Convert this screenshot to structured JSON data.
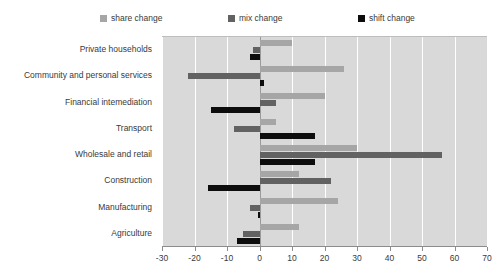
{
  "chart_data": {
    "type": "bar",
    "orientation": "horizontal",
    "title": "",
    "subtitle": "",
    "xlabel": "",
    "ylabel": "",
    "xlim": [
      -30,
      70
    ],
    "xticks": [
      -30,
      -20,
      -10,
      0,
      10,
      20,
      30,
      40,
      50,
      60,
      70
    ],
    "xtick_labels": [
      "-30",
      "-20",
      "-10",
      "0",
      "10",
      "20",
      "30",
      "40",
      "50",
      "60",
      "70"
    ],
    "grid": true,
    "grid_axis": "x",
    "legend_position": "top",
    "categories": [
      "Private households",
      "Community and personal services",
      "Financial intemediation",
      "Transport",
      "Wholesale and retail",
      "Construction",
      "Manufacturing",
      "Agriculture"
    ],
    "series": [
      {
        "name": "share change",
        "color": "#a6a6a6",
        "values": [
          10,
          26,
          20,
          5,
          30,
          12,
          24,
          12
        ]
      },
      {
        "name": "mix change",
        "color": "#626262",
        "values": [
          -2,
          -22,
          5,
          -8,
          56,
          22,
          -3,
          -5
        ]
      },
      {
        "name": "shift change",
        "color": "#0d0d0d",
        "values": [
          -3,
          1.5,
          -15,
          17,
          17,
          -16,
          -0.5,
          -7
        ]
      }
    ]
  },
  "legend": {
    "items": [
      {
        "label": "share change",
        "swatch": "legend-swatch-share"
      },
      {
        "label": "mix change",
        "swatch": "legend-swatch-mix"
      },
      {
        "label": "shift change",
        "swatch": "legend-swatch-shift"
      }
    ]
  },
  "colors": {
    "plot_background": "#d9d9d9",
    "gridline": "#ffffff",
    "zero_line": "#9a9a9a",
    "axis_line": "#8c8c8c",
    "text": "#3a3a3a",
    "share_change": "#a6a6a6",
    "mix_change": "#626262",
    "shift_change": "#0d0d0d"
  }
}
